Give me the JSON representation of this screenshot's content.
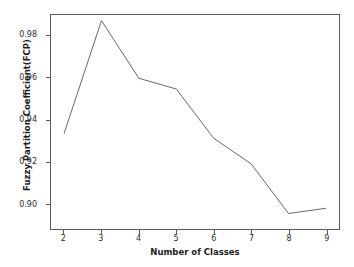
{
  "chart_data": {
    "type": "line",
    "title": "",
    "xlabel": "Number of Classes",
    "ylabel": "Fuzzy Partition Coefficient(FCP)",
    "x": [
      2,
      3,
      4,
      5,
      6,
      7,
      8,
      9
    ],
    "values": [
      0.9334,
      0.9872,
      0.9597,
      0.9546,
      0.9311,
      0.9189,
      0.8952,
      0.8977
    ],
    "xtick_labels": [
      "2",
      "3",
      "4",
      "5",
      "6",
      "7",
      "8",
      "9"
    ],
    "ytick_labels": [
      "0.98",
      "0.96",
      "0.94",
      "0.92",
      "0.90"
    ],
    "ytick_values": [
      0.98,
      0.96,
      0.94,
      0.92,
      0.9
    ],
    "xlim": [
      1.65,
      9.35
    ],
    "ylim": [
      0.8878,
      0.9899
    ],
    "grid": false,
    "legend": null,
    "line_color": "#666666",
    "line_width": 1,
    "marker": "none",
    "axes_color": "#5a5a5a",
    "background": "#ffffff"
  }
}
